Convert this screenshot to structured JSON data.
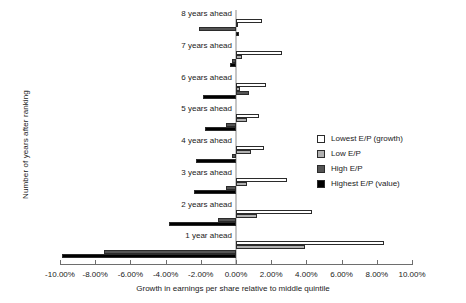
{
  "chart_data": {
    "type": "bar",
    "orientation": "horizontal",
    "title": "",
    "xlabel": "Growth in earnings per share relative to middle quintile",
    "ylabel": "Number of years after ranking",
    "xlim": [
      -0.1,
      0.1
    ],
    "xticks": [
      "-10.00%",
      "-8.00%",
      "-6.00%",
      "-4.00%",
      "-2.00%",
      "0.00%",
      "2.00%",
      "4.00%",
      "6.00%",
      "8.00%",
      "10.00%"
    ],
    "xtick_values": [
      -10,
      -8,
      -6,
      -4,
      -2,
      0,
      2,
      4,
      6,
      8,
      10
    ],
    "grid": false,
    "legend_position": "right",
    "categories": [
      "8 years ahead",
      "7 years ahead",
      "6 years ahead",
      "5 years ahead",
      "4 years ahead",
      "3 years ahead",
      "2 years ahead",
      "1 year ahead"
    ],
    "series": [
      {
        "name": "Lowest E/P (growth)",
        "color": "#ffffff",
        "values": [
          1.5,
          2.6,
          1.7,
          1.3,
          1.6,
          2.9,
          4.3,
          8.4
        ]
      },
      {
        "name": "Low E/P",
        "color": "#b0b0b0",
        "values": [
          0.1,
          0.35,
          0.2,
          0.6,
          0.85,
          0.65,
          1.2,
          3.9
        ]
      },
      {
        "name": "High E/P",
        "color": "#545454",
        "values": [
          -2.1,
          -0.25,
          0.75,
          -0.55,
          -0.2,
          -0.55,
          -1.05,
          -7.5
        ]
      },
      {
        "name": "Highest E/P (value)",
        "color": "#000000",
        "values": [
          0.15,
          -0.35,
          -1.9,
          -1.75,
          -2.25,
          -2.4,
          -3.8,
          -9.9
        ]
      }
    ]
  },
  "legend": {
    "items": [
      {
        "label": "Lowest E/P (growth)"
      },
      {
        "label": "Low E/P"
      },
      {
        "label": "High E/P"
      },
      {
        "label": "Highest E/P (value)"
      }
    ]
  }
}
